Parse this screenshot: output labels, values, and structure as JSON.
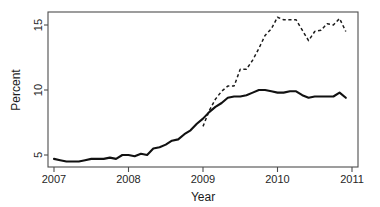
{
  "chart_data": {
    "type": "line",
    "title": "",
    "xlabel": "Year",
    "ylabel": "Percent",
    "xlim": [
      2007.0,
      2011.0
    ],
    "ylim": [
      3.9,
      16.2
    ],
    "grid": false,
    "legend": "none",
    "x_ticks": [
      "2007",
      "2008",
      "2009",
      "2010",
      "2011"
    ],
    "x_tick_values": [
      2007,
      2008,
      2009,
      2010,
      2011
    ],
    "y_ticks": [
      "5",
      "10",
      "15"
    ],
    "y_tick_values": [
      5,
      10,
      15
    ],
    "series": [
      {
        "name": "solid-line",
        "style": "solid",
        "color": "#111111",
        "x": [
          2007.0,
          2007.083,
          2007.167,
          2007.25,
          2007.333,
          2007.417,
          2007.5,
          2007.583,
          2007.667,
          2007.75,
          2007.833,
          2007.917,
          2008.0,
          2008.083,
          2008.167,
          2008.25,
          2008.333,
          2008.417,
          2008.5,
          2008.583,
          2008.667,
          2008.75,
          2008.833,
          2008.917,
          2009.0,
          2009.083,
          2009.167,
          2009.25,
          2009.333,
          2009.417,
          2009.5,
          2009.583,
          2009.667,
          2009.75,
          2009.833,
          2009.917,
          2010.0,
          2010.083,
          2010.167,
          2010.25,
          2010.333,
          2010.417,
          2010.5,
          2010.583,
          2010.667,
          2010.75,
          2010.833,
          2010.917
        ],
        "y": [
          4.7,
          4.6,
          4.5,
          4.5,
          4.5,
          4.6,
          4.7,
          4.7,
          4.7,
          4.8,
          4.7,
          5.0,
          5.0,
          4.9,
          5.1,
          5.0,
          5.5,
          5.6,
          5.8,
          6.1,
          6.2,
          6.6,
          6.9,
          7.4,
          7.8,
          8.3,
          8.7,
          9.0,
          9.4,
          9.5,
          9.5,
          9.6,
          9.8,
          10.0,
          10.0,
          9.9,
          9.8,
          9.8,
          9.9,
          9.9,
          9.6,
          9.4,
          9.5,
          9.5,
          9.5,
          9.5,
          9.8,
          9.4
        ]
      },
      {
        "name": "dashed-line",
        "style": "dashed",
        "color": "#1b1b1b",
        "x": [
          2009.0,
          2009.083,
          2009.167,
          2009.25,
          2009.333,
          2009.417,
          2009.5,
          2009.583,
          2009.667,
          2009.75,
          2009.833,
          2009.917,
          2010.0,
          2010.083,
          2010.167,
          2010.25,
          2010.333,
          2010.417,
          2010.5,
          2010.583,
          2010.667,
          2010.75,
          2010.833,
          2010.917
        ],
        "y": [
          7.2,
          8.4,
          9.3,
          9.9,
          10.3,
          10.3,
          11.6,
          11.6,
          12.3,
          13.2,
          14.2,
          14.7,
          15.6,
          15.4,
          15.4,
          15.4,
          14.6,
          13.8,
          14.5,
          14.6,
          15.1,
          15.0,
          15.5,
          14.5
        ]
      }
    ]
  }
}
